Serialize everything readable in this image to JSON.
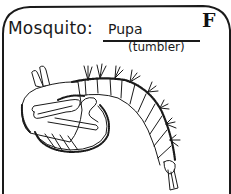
{
  "card": {
    "subject": "Mosquito:",
    "stage": "Pupa",
    "stage_nickname": "(tumbler)",
    "letter": "F"
  },
  "illustration": {
    "name": "mosquito-pupa",
    "description": "Line drawing of a curled mosquito pupa with breathing horns, large cephalothorax and segmented bristled abdomen ending in a paddle"
  },
  "colors": {
    "ink": "#1a1a1a",
    "paper": "#ffffff"
  }
}
